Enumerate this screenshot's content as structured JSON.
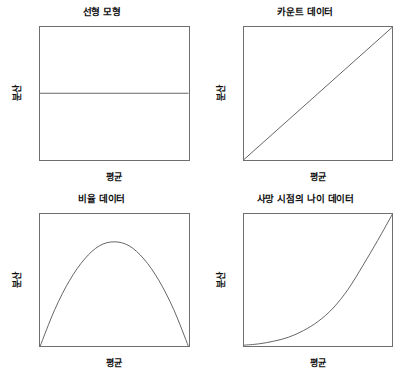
{
  "figure": {
    "background_color": "#ffffff",
    "frame_color": "#6f6f6f",
    "curve_color": "#555555",
    "text_color": "#0e0e0e"
  },
  "chart_data": [
    {
      "type": "line",
      "title": "선형 모형",
      "xlabel": "평균",
      "ylabel": "분산",
      "x": [
        0,
        100
      ],
      "values": [
        50,
        50
      ],
      "xlim": [
        0,
        100
      ],
      "ylim": [
        0,
        100
      ],
      "grid": false,
      "legend": "none",
      "annotation": "분산이 평균과 무관하게 일정함 (상수 분산)"
    },
    {
      "type": "line",
      "title": "카운트 데이터",
      "xlabel": "평균",
      "ylabel": "분산",
      "x": [
        0,
        100
      ],
      "values": [
        0,
        100
      ],
      "xlim": [
        0,
        100
      ],
      "ylim": [
        0,
        100
      ],
      "grid": false,
      "legend": "none",
      "annotation": "분산이 평균에 비례함 (포아송)"
    },
    {
      "type": "line",
      "title": "비율 데이터",
      "xlabel": "평균",
      "ylabel": "분산",
      "x": [
        0,
        10,
        20,
        30,
        40,
        50,
        60,
        70,
        80,
        90,
        100
      ],
      "values": [
        0,
        28,
        50,
        66,
        76,
        79,
        76,
        66,
        50,
        28,
        0
      ],
      "xlim": [
        0,
        100
      ],
      "ylim": [
        0,
        100
      ],
      "grid": false,
      "legend": "none",
      "annotation": "분산이 평균의 이차함수로 뒤집힌 포물선 (이항)"
    },
    {
      "type": "line",
      "title": "사망 시점의 나이 데이터",
      "xlabel": "평균",
      "ylabel": "분산",
      "x": [
        0,
        10,
        20,
        30,
        40,
        50,
        60,
        70,
        80,
        90,
        100
      ],
      "values": [
        1,
        2,
        4,
        7,
        12,
        19,
        29,
        43,
        61,
        80,
        100
      ],
      "xlim": [
        0,
        100
      ],
      "ylim": [
        0,
        100
      ],
      "grid": false,
      "legend": "none",
      "annotation": "분산이 평균의 제곱에 비례하여 증가함 (감마)"
    }
  ],
  "panels": [
    {
      "title": "선형 모형",
      "xlabel": "평균",
      "ylabel": "분산"
    },
    {
      "title": "카운트 데이터",
      "xlabel": "평균",
      "ylabel": "분산"
    },
    {
      "title": "비율 데이터",
      "xlabel": "평균",
      "ylabel": "분산"
    },
    {
      "title": "사망 시점의 나이 데이터",
      "xlabel": "평균",
      "ylabel": "분산"
    }
  ]
}
